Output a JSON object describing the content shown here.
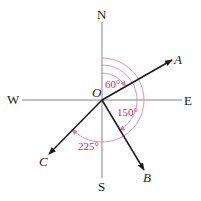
{
  "diagram": {
    "type": "compass-bearing-vectors",
    "origin_label": "O",
    "compass": {
      "north": "N",
      "south": "S",
      "east": "E",
      "west": "W"
    },
    "vectors": [
      {
        "label": "A",
        "bearing_deg": 60
      },
      {
        "label": "B",
        "bearing_deg": 150
      },
      {
        "label": "C",
        "bearing_deg": 225
      }
    ],
    "angle_labels": {
      "a": "60°",
      "b": "150°",
      "c": "225°"
    },
    "colors": {
      "axes": "#777777",
      "vectors": "#1a1a1a",
      "arcs": "#e07aa0",
      "angle_text": "#d4286e"
    }
  }
}
